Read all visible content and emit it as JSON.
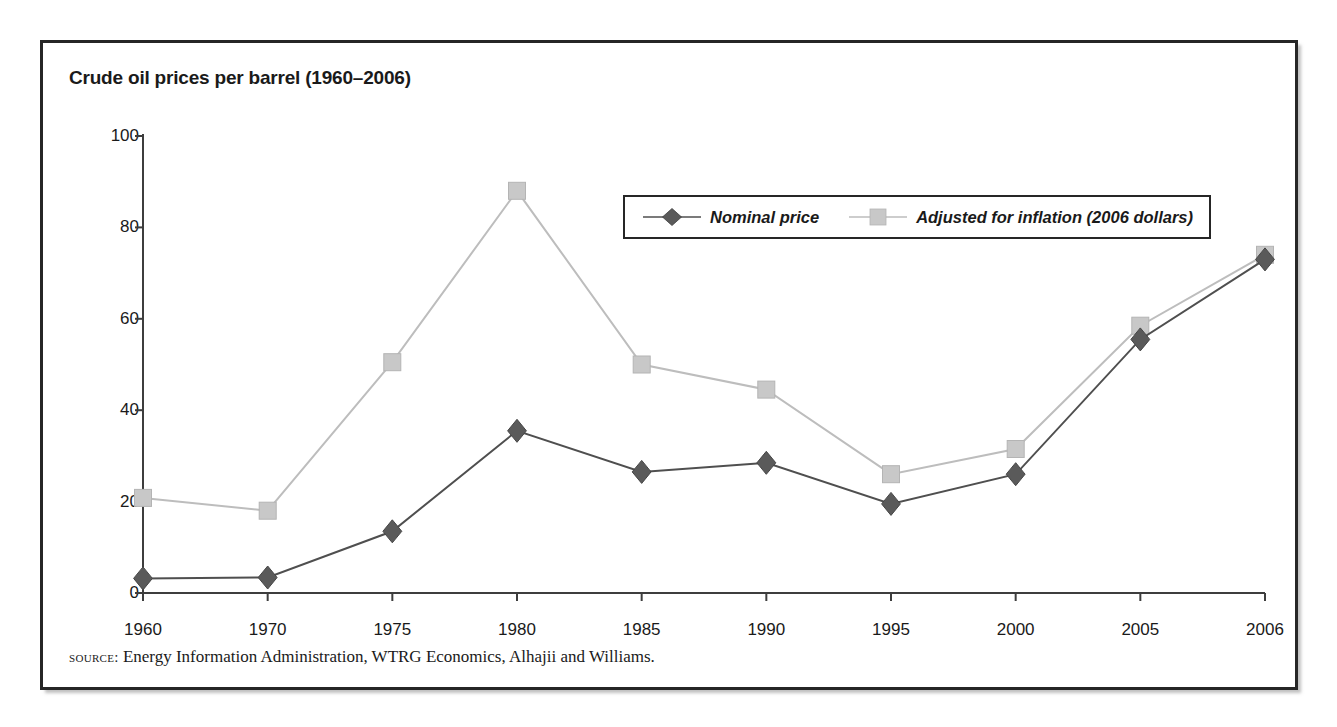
{
  "figure": {
    "title": "Crude oil prices per barrel (1960–2006)",
    "source_label": "source:",
    "source_text": " Energy Information Administration, WTRG Economics, Alhajii and Williams."
  },
  "colors": {
    "frame": "#262626",
    "nominal": "#5a5a5a",
    "adjusted": "#c8c8c8",
    "adjusted_line": "#bdbdbd",
    "axis": "#3d3d3d",
    "text": "#1a1a1a",
    "background": "#ffffff"
  },
  "legend": {
    "position": "inside-upper-right",
    "entries": [
      {
        "label": "Nominal price",
        "marker": "diamond-marker",
        "color": "#5a5a5a"
      },
      {
        "label": "Adjusted for inflation (2006 dollars)",
        "marker": "square-marker",
        "color": "#c8c8c8"
      }
    ]
  },
  "chart_data": {
    "type": "line",
    "title": "Crude oil prices per barrel (1960–2006)",
    "xlabel": "",
    "ylabel": "",
    "categories": [
      "1960",
      "1970",
      "1975",
      "1980",
      "1985",
      "1990",
      "1995",
      "2000",
      "2005",
      "2006"
    ],
    "series": [
      {
        "name": "Nominal price",
        "color": "#5a5a5a",
        "marker": "diamond",
        "values": [
          3.2,
          3.4,
          13.5,
          35.5,
          26.5,
          28.5,
          19.5,
          26.0,
          55.5,
          73.0
        ]
      },
      {
        "name": "Adjusted for inflation (2006 dollars)",
        "color": "#c8c8c8",
        "marker": "square",
        "values": [
          20.8,
          18.0,
          50.5,
          88.0,
          50.0,
          44.5,
          26.0,
          31.5,
          58.5,
          74.0
        ]
      }
    ],
    "ylim": [
      0,
      100
    ],
    "yticks": [
      0,
      20,
      40,
      60,
      80,
      100
    ],
    "ytick_labels": [
      "0",
      "20",
      "40",
      "60",
      "80",
      "100"
    ],
    "grid": false,
    "legend_position": "inside-upper-right"
  }
}
